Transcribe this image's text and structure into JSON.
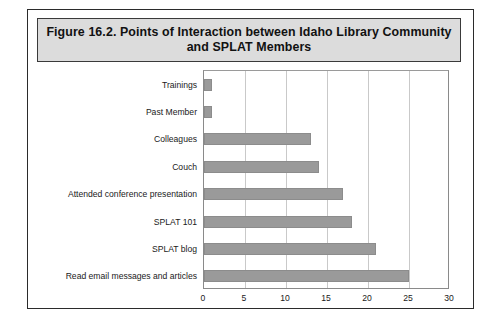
{
  "figure": {
    "title": "Figure 16.2. Points of Interaction between Idaho Library Community and SPLAT Members",
    "title_line1": "Figure 16.2. Points of Interaction between Idaho Library Community",
    "title_line2": "and SPLAT Members"
  },
  "colors": {
    "bar_fill": "#9a9a9a",
    "bar_border": "#8c8c8c",
    "gridline": "#c9c9c9",
    "frame_border": "#2b2b2b",
    "title_background": "#dcdcdc",
    "page_background": "#ffffff",
    "text": "#1a1a1a"
  },
  "chart_data": {
    "type": "bar",
    "orientation": "horizontal",
    "title": "Figure 16.2. Points of Interaction between Idaho Library Community and SPLAT Members",
    "xlabel": "",
    "ylabel": "",
    "xlim": [
      0,
      30
    ],
    "xticks": [
      0,
      5,
      10,
      15,
      20,
      25,
      30
    ],
    "xtick_labels": [
      "0",
      "5",
      "10",
      "15",
      "20",
      "25",
      "30"
    ],
    "grid": true,
    "legend": false,
    "categories": [
      "Trainings",
      "Past Member",
      "Colleagues",
      "Couch",
      "Attended conference presentation",
      "SPLAT 101",
      "SPLAT blog",
      "Read email messages and articles"
    ],
    "values": [
      1,
      1,
      13,
      14,
      17,
      18,
      21,
      25
    ]
  }
}
